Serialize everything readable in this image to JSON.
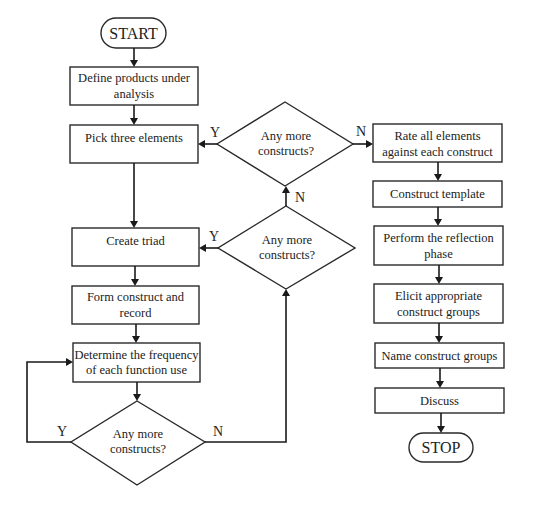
{
  "flowchart": {
    "start": "START",
    "stop": "STOP",
    "left_column": {
      "define": [
        "Define products under",
        "analysis"
      ],
      "pick": [
        "Pick three elements"
      ],
      "create_triad": [
        "Create triad"
      ],
      "form_construct": [
        "Form construct and",
        "record"
      ],
      "determine": [
        "Determine the frequency",
        "of each function use"
      ]
    },
    "decisions": {
      "top": [
        "Any more",
        "constructs?"
      ],
      "middle": [
        "Any more",
        "constructs?"
      ],
      "bottom": [
        "Any more",
        "constructs?"
      ]
    },
    "right_column": {
      "rate": [
        "Rate all elements",
        "against each construct"
      ],
      "template": [
        "Construct template"
      ],
      "reflection": [
        "Perform the reflection",
        "phase"
      ],
      "elicit": [
        "Elicit appropriate",
        "construct groups"
      ],
      "name_groups": [
        "Name construct groups"
      ],
      "discuss": [
        "Discuss"
      ]
    },
    "edge_labels": {
      "yes": "Y",
      "no": "N"
    }
  }
}
